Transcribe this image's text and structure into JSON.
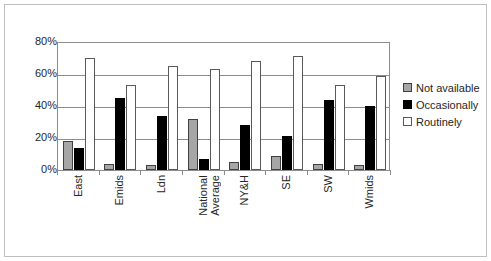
{
  "chart_data": {
    "type": "bar",
    "title": "",
    "subtitle": "",
    "xlabel": "",
    "ylabel": "",
    "grid": true,
    "legend_position": "right",
    "ylim": [
      0,
      80
    ],
    "y_ticks": [
      "0%",
      "20%",
      "40%",
      "60%",
      "80%"
    ],
    "y_tick_values": [
      0,
      20,
      40,
      60,
      80
    ],
    "categories": [
      "East",
      "Emids",
      "Ldn",
      "National\nAverage",
      "NY&H",
      "SE",
      "SW",
      "Wmids"
    ],
    "series": [
      {
        "name": "Not available",
        "color": "#a6a6a6",
        "values": [
          18,
          4,
          3,
          32,
          5,
          9,
          4,
          3
        ]
      },
      {
        "name": "Occasionally",
        "color": "#000000",
        "values": [
          14,
          45,
          34,
          7,
          28,
          21,
          44,
          40
        ]
      },
      {
        "name": "Routinely",
        "color": "#ffffff",
        "values": [
          70,
          53,
          65,
          63,
          68,
          71,
          53,
          59
        ]
      }
    ]
  },
  "legend": {
    "items": [
      {
        "label": "Not available",
        "swatch": "notavail"
      },
      {
        "label": "Occasionally",
        "swatch": "occasionally"
      },
      {
        "label": "Routinely",
        "swatch": "routinely"
      }
    ]
  }
}
